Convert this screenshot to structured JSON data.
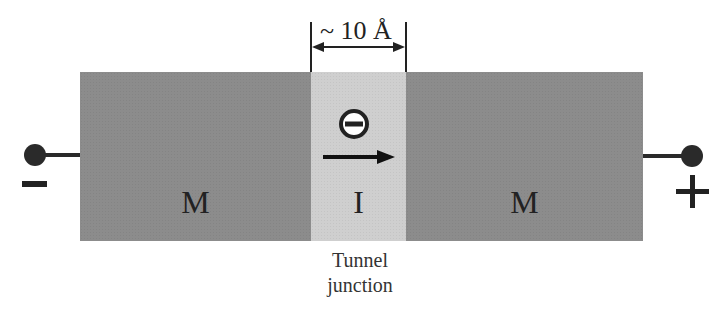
{
  "diagram": {
    "type": "tunnel-junction-schematic",
    "layers": [
      {
        "label": "M",
        "role": "metal-left",
        "color": "#8c8c8c"
      },
      {
        "label": "I",
        "role": "insulator",
        "color": "#cfcfcf"
      },
      {
        "label": "M",
        "role": "metal-right",
        "color": "#8c8c8c"
      }
    ],
    "dimension_label": "~ 10 Å",
    "caption_line1": "Tunnel",
    "caption_line2": "junction",
    "left_terminal_sign": "−",
    "right_terminal_sign": "+",
    "electron_symbol": "electron-minus-icon",
    "arrow_direction": "right"
  }
}
